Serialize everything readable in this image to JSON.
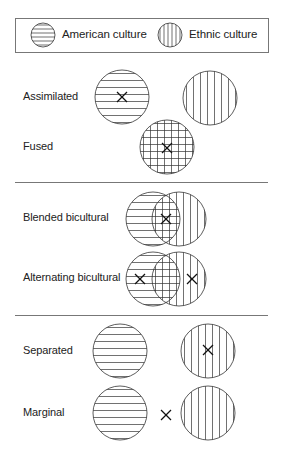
{
  "legend": {
    "american_label": "American culture",
    "ethnic_label": "Ethnic culture"
  },
  "patterns": {
    "american": "horizontal-lines",
    "ethnic": "vertical-lines",
    "combined": "grid"
  },
  "rows": [
    {
      "label": "Assimilated",
      "configuration": "separate",
      "position": "american"
    },
    {
      "label": "Fused",
      "configuration": "single-combined",
      "position": "fused"
    },
    {
      "label": "Blended bicultural",
      "configuration": "overlap",
      "position": "intersection"
    },
    {
      "label": "Alternating bicultural",
      "configuration": "overlap",
      "position": "both-non-intersection"
    },
    {
      "label": "Separated",
      "configuration": "separate",
      "position": "ethnic"
    },
    {
      "label": "Marginal",
      "configuration": "separate",
      "position": "between"
    }
  ],
  "colors": {
    "stroke": "#333333",
    "divider": "#777777"
  }
}
